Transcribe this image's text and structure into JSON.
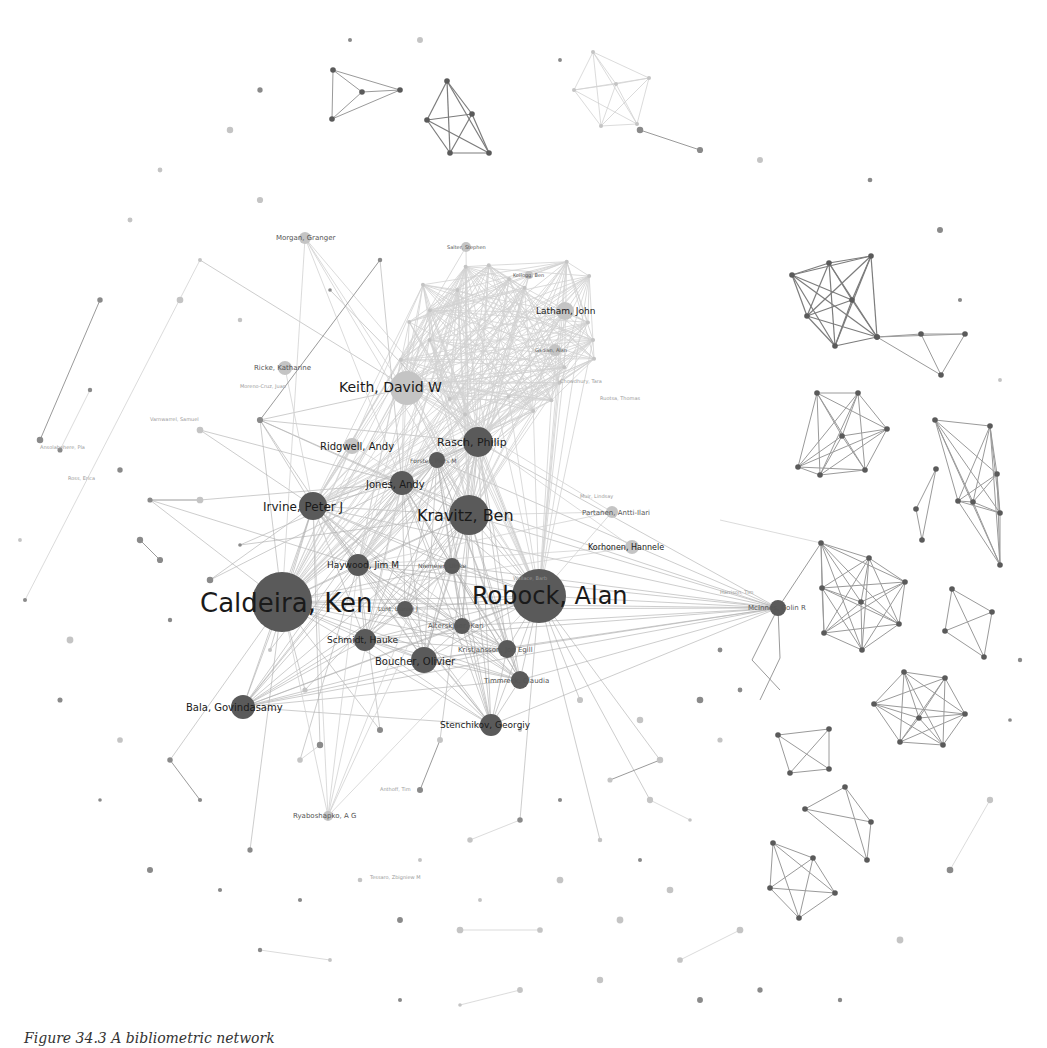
{
  "figure": {
    "caption": "Figure 34.3 A bibliometric network"
  },
  "network": {
    "colors": {
      "node_dark": "#5a5a5a",
      "node_light": "#c4c4c4",
      "edge": "#9a9a9a",
      "background": "#ffffff"
    },
    "major_nodes": [
      {
        "id": "caldeira",
        "label": "Caldeira, Ken",
        "x": 282,
        "y": 602,
        "r": 30,
        "font": 26,
        "shade": "dark",
        "lx": 200,
        "ly": 612
      },
      {
        "id": "robock",
        "label": "Robock, Alan",
        "x": 539,
        "y": 596,
        "r": 27,
        "font": 24,
        "shade": "dark",
        "lx": 472,
        "ly": 604
      },
      {
        "id": "kravitz",
        "label": "Kravitz, Ben",
        "x": 469,
        "y": 515,
        "r": 20,
        "font": 16,
        "shade": "dark",
        "lx": 417,
        "ly": 521
      },
      {
        "id": "keith",
        "label": "Keith, David W",
        "x": 407,
        "y": 388,
        "r": 17,
        "font": 14,
        "shade": "light",
        "lx": 339,
        "ly": 392
      },
      {
        "id": "rasch",
        "label": "Rasch, Philip",
        "x": 478,
        "y": 442,
        "r": 15,
        "font": 11,
        "shade": "dark",
        "lx": 437,
        "ly": 446
      },
      {
        "id": "irvine",
        "label": "Irvine, Peter J",
        "x": 313,
        "y": 506,
        "r": 14,
        "font": 12,
        "shade": "dark",
        "lx": 263,
        "ly": 511
      },
      {
        "id": "jones",
        "label": "Jones, Andy",
        "x": 402,
        "y": 483,
        "r": 12,
        "font": 10,
        "shade": "dark",
        "lx": 366,
        "ly": 488
      },
      {
        "id": "haywood",
        "label": "Haywood, Jim M",
        "x": 358,
        "y": 565,
        "r": 11,
        "font": 9,
        "shade": "dark",
        "lx": 327,
        "ly": 568
      },
      {
        "id": "boucher",
        "label": "Boucher, Olivier",
        "x": 424,
        "y": 660,
        "r": 13,
        "font": 10,
        "shade": "dark",
        "lx": 375,
        "ly": 665
      },
      {
        "id": "schmidt",
        "label": "Schmidt, Hauke",
        "x": 365,
        "y": 640,
        "r": 11,
        "font": 9,
        "shade": "dark",
        "lx": 327,
        "ly": 643
      },
      {
        "id": "bala",
        "label": "Bala, Govindasamy",
        "x": 243,
        "y": 707,
        "r": 12,
        "font": 10,
        "shade": "dark",
        "lx": 186,
        "ly": 711
      },
      {
        "id": "stenchikov",
        "label": "Stenchikov, Georgiy",
        "x": 491,
        "y": 725,
        "r": 11,
        "font": 9,
        "shade": "dark",
        "lx": 440,
        "ly": 728
      },
      {
        "id": "kristjansson",
        "label": "Kristjansson, Jon Egill",
        "x": 507,
        "y": 649,
        "r": 9,
        "font": 7,
        "shade": "dark",
        "lx": 458,
        "ly": 652
      },
      {
        "id": "alterskjaer",
        "label": "Alterskjaer, Kari",
        "x": 462,
        "y": 626,
        "r": 8,
        "font": 7,
        "shade": "dark",
        "lx": 428,
        "ly": 628
      },
      {
        "id": "timmreck",
        "label": "Timmreck, Claudia",
        "x": 520,
        "y": 680,
        "r": 9,
        "font": 7,
        "shade": "dark",
        "lx": 484,
        "ly": 683
      },
      {
        "id": "niemeier",
        "label": "Niemeier, Ulrike",
        "x": 452,
        "y": 566,
        "r": 8,
        "font": 6,
        "shade": "dark",
        "lx": 418,
        "ly": 568
      },
      {
        "id": "egill3",
        "label": "Lunt, Daniel J",
        "x": 405,
        "y": 609,
        "r": 8,
        "font": 6,
        "shade": "dark",
        "lx": 378,
        "ly": 611
      },
      {
        "id": "forster",
        "label": "Forster, Piers M",
        "x": 437,
        "y": 460,
        "r": 8,
        "font": 6,
        "shade": "dark",
        "lx": 410,
        "ly": 463
      },
      {
        "id": "ridgwell",
        "label": "Ridgwell, Andy",
        "x": 352,
        "y": 446,
        "r": 8,
        "font": 10,
        "shade": "light",
        "lx": 320,
        "ly": 450
      },
      {
        "id": "latham",
        "label": "Latham, John",
        "x": 565,
        "y": 311,
        "r": 9,
        "font": 9,
        "shade": "light",
        "lx": 536,
        "ly": 314
      },
      {
        "id": "ricke",
        "label": "Ricke, Katharine",
        "x": 285,
        "y": 368,
        "r": 7,
        "font": 7,
        "shade": "light",
        "lx": 254,
        "ly": 370
      },
      {
        "id": "morgan",
        "label": "Morgan, Granger",
        "x": 305,
        "y": 238,
        "r": 6,
        "font": 7,
        "shade": "light",
        "lx": 276,
        "ly": 240
      },
      {
        "id": "partanen",
        "label": "Partanen, Antti-Ilari",
        "x": 612,
        "y": 512,
        "r": 6,
        "font": 7,
        "shade": "light",
        "lx": 582,
        "ly": 515
      },
      {
        "id": "korhonen",
        "label": "Korhonen, Hannele",
        "x": 632,
        "y": 547,
        "r": 7,
        "font": 8,
        "shade": "light",
        "lx": 588,
        "ly": 550
      },
      {
        "id": "mcinnes",
        "label": "McInnes, Colin R",
        "x": 778,
        "y": 608,
        "r": 8,
        "font": 7,
        "shade": "dark",
        "lx": 748,
        "ly": 610
      },
      {
        "id": "ryaboshapko",
        "label": "Ryaboshapko, A G",
        "x": 328,
        "y": 816,
        "r": 5,
        "font": 7,
        "shade": "light",
        "lx": 293,
        "ly": 818
      },
      {
        "id": "gadian",
        "label": "Gadian, Alan",
        "x": 555,
        "y": 350,
        "r": 6,
        "font": 5,
        "shade": "light",
        "lx": 535,
        "ly": 352
      },
      {
        "id": "salter",
        "label": "Salter, Stephen",
        "x": 466,
        "y": 247,
        "r": 5,
        "font": 5,
        "shade": "light",
        "lx": 447,
        "ly": 249
      },
      {
        "id": "kellogg",
        "label": "Kellogg, Ben",
        "x": 529,
        "y": 275,
        "r": 4,
        "font": 5,
        "shade": "light",
        "lx": 513,
        "ly": 277
      }
    ],
    "cliques": [
      {
        "name": "top-tetra",
        "shade": "dark",
        "pts": [
          [
            447,
            81
          ],
          [
            427,
            120
          ],
          [
            472,
            114
          ],
          [
            489,
            153
          ],
          [
            450,
            153
          ]
        ]
      },
      {
        "name": "top-triangle",
        "shade": "mid",
        "pts": [
          [
            333,
            70
          ],
          [
            362,
            92
          ],
          [
            332,
            119
          ],
          [
            400,
            90
          ]
        ]
      },
      {
        "name": "top-right-penta",
        "shade": "faint",
        "pts": [
          [
            593,
            52
          ],
          [
            574,
            90
          ],
          [
            616,
            84
          ],
          [
            649,
            78
          ],
          [
            601,
            126
          ],
          [
            637,
            124
          ]
        ]
      },
      {
        "name": "right-upper-hex",
        "shade": "dark",
        "pts": [
          [
            792,
            275
          ],
          [
            829,
            263
          ],
          [
            852,
            300
          ],
          [
            807,
            316
          ],
          [
            835,
            346
          ],
          [
            877,
            337
          ],
          [
            871,
            256
          ]
        ]
      },
      {
        "name": "right-triangle",
        "shade": "mid",
        "pts": [
          [
            877,
            337
          ],
          [
            921,
            334
          ],
          [
            965,
            334
          ],
          [
            941,
            375
          ]
        ]
      },
      {
        "name": "right-mid-hex",
        "shade": "mid",
        "pts": [
          [
            817,
            393
          ],
          [
            858,
            393
          ],
          [
            887,
            429
          ],
          [
            798,
            467
          ],
          [
            820,
            475
          ],
          [
            865,
            470
          ],
          [
            842,
            436
          ]
        ]
      },
      {
        "name": "right-center-hex",
        "shade": "mid",
        "pts": [
          [
            821,
            543
          ],
          [
            869,
            558
          ],
          [
            905,
            582
          ],
          [
            822,
            588
          ],
          [
            861,
            602
          ],
          [
            899,
            624
          ],
          [
            824,
            633
          ],
          [
            862,
            650
          ]
        ]
      },
      {
        "name": "right-quad",
        "shade": "mid",
        "pts": [
          [
            952,
            589
          ],
          [
            992,
            612
          ],
          [
            945,
            631
          ],
          [
            984,
            657
          ]
        ]
      },
      {
        "name": "bottom-right-hex",
        "shade": "mid",
        "pts": [
          [
            904,
            672
          ],
          [
            945,
            678
          ],
          [
            874,
            704
          ],
          [
            965,
            714
          ],
          [
            919,
            718
          ],
          [
            900,
            742
          ],
          [
            943,
            745
          ]
        ]
      },
      {
        "name": "right-small-triangle",
        "shade": "mid",
        "pts": [
          [
            936,
            469
          ],
          [
            916,
            509
          ],
          [
            922,
            540
          ]
        ]
      },
      {
        "name": "far-right-group",
        "shade": "mid",
        "pts": [
          [
            935,
            420
          ],
          [
            990,
            426
          ],
          [
            997,
            474
          ],
          [
            958,
            501
          ],
          [
            973,
            502
          ],
          [
            1000,
            513
          ],
          [
            1000,
            565
          ]
        ]
      },
      {
        "name": "bottom-right-penta",
        "shade": "mid",
        "pts": [
          [
            773,
            843
          ],
          [
            813,
            858
          ],
          [
            770,
            888
          ],
          [
            835,
            893
          ],
          [
            799,
            918
          ]
        ]
      },
      {
        "name": "bottom-right-tri",
        "shade": "mid",
        "pts": [
          [
            805,
            809
          ],
          [
            845,
            787
          ],
          [
            871,
            822
          ],
          [
            867,
            860
          ]
        ]
      },
      {
        "name": "bottom-triangle-2",
        "shade": "mid",
        "pts": [
          [
            778,
            735
          ],
          [
            829,
            729
          ],
          [
            790,
            773
          ],
          [
            829,
            769
          ]
        ]
      }
    ],
    "hub_ring": {
      "cx": 500,
      "cy": 340,
      "r": 115,
      "count": 26
    },
    "scatter_nodes": [
      [
        90,
        390
      ],
      [
        60,
        450
      ],
      [
        120,
        470
      ],
      [
        140,
        540
      ],
      [
        160,
        560
      ],
      [
        170,
        620
      ],
      [
        70,
        640
      ],
      [
        60,
        700
      ],
      [
        120,
        740
      ],
      [
        100,
        800
      ],
      [
        150,
        870
      ],
      [
        220,
        890
      ],
      [
        260,
        950
      ],
      [
        330,
        960
      ],
      [
        400,
        1000
      ],
      [
        460,
        1005
      ],
      [
        520,
        990
      ],
      [
        600,
        980
      ],
      [
        680,
        960
      ],
      [
        740,
        930
      ],
      [
        700,
        1000
      ],
      [
        760,
        990
      ],
      [
        840,
        1000
      ],
      [
        900,
        940
      ],
      [
        950,
        870
      ],
      [
        990,
        800
      ],
      [
        1010,
        720
      ],
      [
        1020,
        660
      ],
      [
        1000,
        380
      ],
      [
        960,
        300
      ],
      [
        940,
        230
      ],
      [
        870,
        180
      ],
      [
        760,
        160
      ],
      [
        700,
        150
      ],
      [
        640,
        130
      ],
      [
        560,
        60
      ],
      [
        420,
        40
      ],
      [
        350,
        40
      ],
      [
        260,
        90
      ],
      [
        230,
        130
      ],
      [
        160,
        170
      ],
      [
        130,
        220
      ],
      [
        100,
        300
      ],
      [
        40,
        440
      ],
      [
        20,
        540
      ],
      [
        25,
        600
      ],
      [
        200,
        260
      ],
      [
        260,
        200
      ],
      [
        180,
        300
      ],
      [
        240,
        320
      ],
      [
        330,
        290
      ],
      [
        380,
        260
      ],
      [
        260,
        420
      ],
      [
        200,
        430
      ],
      [
        150,
        500
      ],
      [
        200,
        500
      ],
      [
        240,
        545
      ],
      [
        210,
        580
      ],
      [
        270,
        650
      ],
      [
        305,
        690
      ],
      [
        320,
        745
      ],
      [
        300,
        760
      ],
      [
        380,
        730
      ],
      [
        440,
        740
      ],
      [
        420,
        790
      ],
      [
        520,
        730
      ],
      [
        580,
        700
      ],
      [
        640,
        720
      ],
      [
        700,
        700
      ],
      [
        720,
        650
      ],
      [
        740,
        690
      ],
      [
        720,
        740
      ],
      [
        660,
        760
      ],
      [
        610,
        780
      ],
      [
        560,
        800
      ],
      [
        520,
        820
      ],
      [
        470,
        840
      ],
      [
        600,
        840
      ],
      [
        650,
        800
      ],
      [
        690,
        820
      ],
      [
        640,
        860
      ],
      [
        560,
        880
      ],
      [
        480,
        900
      ],
      [
        420,
        860
      ],
      [
        360,
        880
      ],
      [
        300,
        900
      ],
      [
        250,
        850
      ],
      [
        200,
        800
      ],
      [
        170,
        760
      ],
      [
        400,
        920
      ],
      [
        460,
        930
      ],
      [
        540,
        930
      ],
      [
        620,
        920
      ],
      [
        670,
        890
      ]
    ],
    "faint_labels": [
      {
        "x": 40,
        "y": 449,
        "text": "Ansolabehere, Pla"
      },
      {
        "x": 150,
        "y": 421,
        "text": "Varnwarrel, Samuel"
      },
      {
        "x": 68,
        "y": 480,
        "text": "Ross, Erica"
      },
      {
        "x": 240,
        "y": 388,
        "text": "Moreno-Cruz, Juan"
      },
      {
        "x": 560,
        "y": 383,
        "text": "Chowdhury, Tara"
      },
      {
        "x": 600,
        "y": 400,
        "text": "Ruotsa, Thomas"
      },
      {
        "x": 513,
        "y": 580,
        "text": "Wallace, Barb"
      },
      {
        "x": 720,
        "y": 594,
        "text": "Harrison, Tim"
      },
      {
        "x": 580,
        "y": 498,
        "text": "Muir, Lindsay"
      },
      {
        "x": 380,
        "y": 791,
        "text": "Anthoff, Tim"
      },
      {
        "x": 370,
        "y": 879,
        "text": "Tessaro, Zbigniew M"
      }
    ]
  }
}
